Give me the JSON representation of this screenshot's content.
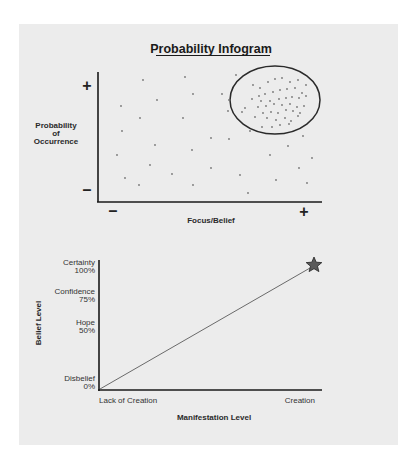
{
  "chart_data": [
    {
      "type": "scatter",
      "title": "Probability Infogram",
      "xlabel": "Focus/Belief",
      "ylabel": "Probability of Occurrence",
      "ylabel_lines": [
        "Probability",
        "of",
        "Occurrence"
      ],
      "x_ticks": {
        "low": "–",
        "high": "+"
      },
      "y_ticks": {
        "low": "–",
        "high": "+"
      },
      "annotation": "Ellipse highlighting dense cluster at high Focus/Belief and high Probability",
      "points_sparse": [
        [
          143,
          80
        ],
        [
          185,
          77
        ],
        [
          121,
          106
        ],
        [
          157,
          100
        ],
        [
          193,
          94
        ],
        [
          122,
          131
        ],
        [
          140,
          118
        ],
        [
          183,
          118
        ],
        [
          117,
          155
        ],
        [
          155,
          145
        ],
        [
          192,
          150
        ],
        [
          150,
          165
        ],
        [
          211,
          138
        ],
        [
          229,
          139
        ],
        [
          172,
          174
        ],
        [
          211,
          168
        ],
        [
          125,
          178
        ],
        [
          139,
          185
        ],
        [
          193,
          185
        ],
        [
          240,
          175
        ],
        [
          248,
          193
        ],
        [
          276,
          180
        ],
        [
          299,
          168
        ],
        [
          270,
          155
        ],
        [
          288,
          146
        ],
        [
          303,
          136
        ],
        [
          312,
          158
        ],
        [
          307,
          183
        ],
        [
          236,
          75
        ],
        [
          222,
          94
        ],
        [
          229,
          100
        ],
        [
          228,
          111
        ],
        [
          250,
          131
        ]
      ],
      "points_cluster": [
        [
          253,
          85
        ],
        [
          260,
          88
        ],
        [
          268,
          82
        ],
        [
          275,
          79
        ],
        [
          282,
          78
        ],
        [
          290,
          82
        ],
        [
          298,
          80
        ],
        [
          306,
          85
        ],
        [
          259,
          96
        ],
        [
          265,
          94
        ],
        [
          273,
          92
        ],
        [
          280,
          90
        ],
        [
          287,
          89
        ],
        [
          295,
          88
        ],
        [
          302,
          93
        ],
        [
          306,
          96
        ],
        [
          252,
          99
        ],
        [
          261,
          101
        ],
        [
          270,
          101
        ],
        [
          279,
          99
        ],
        [
          286,
          98
        ],
        [
          292,
          97
        ],
        [
          299,
          98
        ],
        [
          258,
          107
        ],
        [
          266,
          106
        ],
        [
          274,
          104
        ],
        [
          282,
          105
        ],
        [
          290,
          104
        ],
        [
          297,
          107
        ],
        [
          304,
          106
        ],
        [
          263,
          113
        ],
        [
          271,
          112
        ],
        [
          278,
          113
        ],
        [
          286,
          110
        ],
        [
          293,
          111
        ],
        [
          300,
          113
        ],
        [
          255,
          117
        ],
        [
          267,
          118
        ],
        [
          276,
          120
        ],
        [
          285,
          118
        ],
        [
          291,
          121
        ],
        [
          298,
          116
        ],
        [
          262,
          127
        ],
        [
          280,
          125
        ],
        [
          289,
          124
        ],
        [
          272,
          127
        ],
        [
          245,
          108
        ],
        [
          242,
          112
        ]
      ],
      "ellipse": {
        "cx": 275,
        "cy": 100,
        "rx": 45,
        "ry": 34
      }
    },
    {
      "type": "line",
      "xlabel": "Manifestation Level",
      "ylabel": "Belief Level",
      "x_ticks": [
        "Lack of Creation",
        "Creation"
      ],
      "y_ticks": [
        {
          "label": "Disbelief",
          "value": "0%"
        },
        {
          "label": "Hope",
          "value": "50%"
        },
        {
          "label": "Confidence",
          "value": "75%"
        },
        {
          "label": "Certainty",
          "value": "100%"
        }
      ],
      "x": [
        0,
        1
      ],
      "y": [
        0,
        100
      ],
      "ylim": [
        0,
        100
      ],
      "end_marker": "star"
    }
  ],
  "top": {
    "title": "Probability Infogram",
    "ylabel_1": "Probability",
    "ylabel_2": "of",
    "ylabel_3": "Occurrence",
    "xlabel": "Focus/Belief",
    "plus": "+",
    "minus": "–"
  },
  "bottom": {
    "ylabel": "Belief Level",
    "xlabel": "Manifestation Level",
    "x_low": "Lack of Creation",
    "x_high": "Creation",
    "t100_name": "Certainty",
    "t100_val": "100%",
    "t75_name": "Confidence",
    "t75_val": "75%",
    "t50_name": "Hope",
    "t50_val": "50%",
    "t0_name": "Disbelief",
    "t0_val": "0%"
  },
  "colors": {
    "panel": "#ececec",
    "axis": "#1a1a1a",
    "dot": "#777777",
    "line": "#666666",
    "star": "#555555"
  }
}
